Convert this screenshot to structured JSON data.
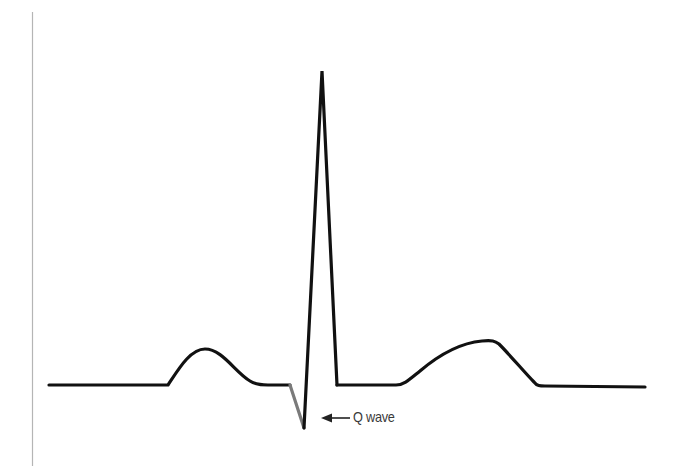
{
  "diagram": {
    "type": "ecg-waveform",
    "colors": {
      "trace": "#111111",
      "q_wave_segment": "#7a7a7a",
      "axis_line": "#b5b5b5",
      "label": "#3a3a3a",
      "arrow": "#222222"
    },
    "segments": [
      {
        "name": "baseline-start",
        "color": "trace"
      },
      {
        "name": "p-wave",
        "color": "trace"
      },
      {
        "name": "pr-segment",
        "color": "trace"
      },
      {
        "name": "q-wave",
        "color": "q_wave_segment"
      },
      {
        "name": "r-wave",
        "color": "trace"
      },
      {
        "name": "s-wave",
        "color": "trace"
      },
      {
        "name": "st-segment",
        "color": "trace"
      },
      {
        "name": "t-wave",
        "color": "trace"
      },
      {
        "name": "baseline-end",
        "color": "trace"
      }
    ],
    "annotations": [
      {
        "id": "q-wave-label",
        "text": "Q wave",
        "arrow": "left-arrow"
      }
    ]
  }
}
